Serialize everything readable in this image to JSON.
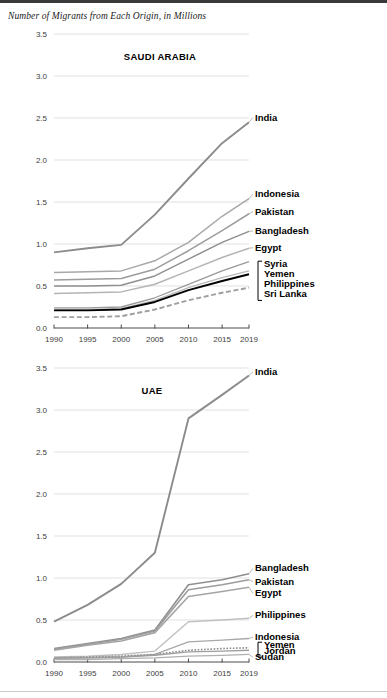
{
  "figure": {
    "title": "Number of Migrants from Each Origin, in Millions"
  },
  "chart_data": [
    {
      "type": "line",
      "title": "SAUDI ARABIA",
      "xlabel": "",
      "ylabel": "",
      "x": [
        1990,
        1995,
        2000,
        2005,
        2010,
        2015,
        2019
      ],
      "xticklabels": [
        "1990",
        "1995",
        "2000",
        "2005",
        "2010",
        "2015",
        "2019"
      ],
      "yticklabels": [
        "0.0",
        "0.5",
        "1.0",
        "1.5",
        "2.0",
        "2.5",
        "3.0",
        "3.5"
      ],
      "ylim": [
        0.0,
        3.5
      ],
      "ytickstep": 0.5,
      "grid": true,
      "legend_position": "right-inline",
      "series": [
        {
          "name": "India",
          "values": [
            0.9,
            0.95,
            0.99,
            1.35,
            1.78,
            2.2,
            2.45
          ],
          "color": "#8c8c8c",
          "style": "solid",
          "width": 1.9,
          "label_y": 2.47
        },
        {
          "name": "Indonesia",
          "values": [
            0.66,
            0.67,
            0.68,
            0.8,
            1.02,
            1.33,
            1.54
          ],
          "color": "#a8a8a8",
          "style": "solid",
          "width": 1.5,
          "label_y": 1.56
        },
        {
          "name": "Pakistan",
          "values": [
            0.57,
            0.58,
            0.59,
            0.7,
            0.92,
            1.16,
            1.36
          ],
          "color": "#9c9c9c",
          "style": "solid",
          "width": 1.5,
          "label_y": 1.35
        },
        {
          "name": "Bangladesh",
          "values": [
            0.5,
            0.5,
            0.51,
            0.62,
            0.82,
            1.02,
            1.15
          ],
          "color": "#8f8f8f",
          "style": "solid",
          "width": 1.5,
          "label_y": 1.12
        },
        {
          "name": "Egypt",
          "values": [
            0.41,
            0.42,
            0.43,
            0.52,
            0.68,
            0.84,
            0.95
          ],
          "color": "#b4b4b4",
          "style": "solid",
          "width": 1.5,
          "label_y": 0.92
        },
        {
          "name": "Syria",
          "values": [
            0.24,
            0.24,
            0.25,
            0.36,
            0.52,
            0.68,
            0.79
          ],
          "color": "#9a9a9a",
          "style": "solid",
          "width": 1.3,
          "label_y": 0.73
        },
        {
          "name": "Yemen",
          "values": [
            0.22,
            0.22,
            0.23,
            0.33,
            0.48,
            0.6,
            0.68
          ],
          "color": "#b9b9b9",
          "style": "solid",
          "width": 1.3,
          "label_y": 0.61
        },
        {
          "name": "Philippines",
          "values": [
            0.21,
            0.21,
            0.22,
            0.31,
            0.45,
            0.56,
            0.64
          ],
          "color": "#000000",
          "style": "solid",
          "width": 1.9,
          "label_y": 0.49
        },
        {
          "name": "Sri Lanka",
          "values": [
            0.13,
            0.13,
            0.14,
            0.22,
            0.33,
            0.42,
            0.48
          ],
          "color": "#9e9e9e",
          "style": "dashed",
          "width": 1.9,
          "label_y": 0.37
        }
      ],
      "brackets": [
        {
          "members": [
            "Syria",
            "Yemen",
            "Philippines",
            "Sri Lanka"
          ]
        }
      ]
    },
    {
      "type": "line",
      "title": "UAE",
      "xlabel": "",
      "ylabel": "",
      "x": [
        1990,
        1995,
        2000,
        2005,
        2010,
        2015,
        2019
      ],
      "xticklabels": [
        "1990",
        "1995",
        "2000",
        "2005",
        "2010",
        "2015",
        "2019"
      ],
      "yticklabels": [
        "0.0",
        "0.5",
        "1.0",
        "1.5",
        "2.0",
        "2.5",
        "3.0",
        "3.5"
      ],
      "ylim": [
        0.0,
        3.5
      ],
      "ytickstep": 0.5,
      "grid": true,
      "legend_position": "right-inline",
      "series": [
        {
          "name": "India",
          "values": [
            0.48,
            0.68,
            0.93,
            1.3,
            2.9,
            3.18,
            3.41
          ],
          "color": "#8c8c8c",
          "style": "solid",
          "width": 1.9,
          "label_y": 3.42
        },
        {
          "name": "Bangladesh",
          "values": [
            0.16,
            0.22,
            0.28,
            0.38,
            0.92,
            0.98,
            1.05
          ],
          "color": "#8f8f8f",
          "style": "solid",
          "width": 1.6,
          "label_y": 1.08
        },
        {
          "name": "Pakistan",
          "values": [
            0.15,
            0.21,
            0.27,
            0.37,
            0.86,
            0.92,
            0.98
          ],
          "color": "#9c9c9c",
          "style": "solid",
          "width": 1.6,
          "label_y": 0.92
        },
        {
          "name": "Egypt",
          "values": [
            0.14,
            0.2,
            0.25,
            0.35,
            0.78,
            0.84,
            0.89
          ],
          "color": "#a5a5a5",
          "style": "solid",
          "width": 1.6,
          "label_y": 0.78
        },
        {
          "name": "Philippines",
          "values": [
            0.06,
            0.07,
            0.09,
            0.13,
            0.48,
            0.5,
            0.52
          ],
          "color": "#c0c0c0",
          "style": "solid",
          "width": 1.4,
          "label_y": 0.52
        },
        {
          "name": "Indonesia",
          "values": [
            0.04,
            0.05,
            0.06,
            0.09,
            0.24,
            0.26,
            0.28
          ],
          "color": "#a8a8a8",
          "style": "solid",
          "width": 1.4,
          "label_y": 0.26
        },
        {
          "name": "Yemen",
          "values": [
            0.05,
            0.06,
            0.07,
            0.09,
            0.14,
            0.16,
            0.17
          ],
          "color": "#8a8a8a",
          "style": "dotted",
          "width": 1.6,
          "label_y": 0.17
        },
        {
          "name": "Jordan",
          "values": [
            0.05,
            0.05,
            0.06,
            0.08,
            0.12,
            0.13,
            0.14
          ],
          "color": "#9e9e9e",
          "style": "solid",
          "width": 1.4,
          "label_y": 0.1
        },
        {
          "name": "Sudan",
          "values": [
            0.03,
            0.03,
            0.04,
            0.05,
            0.07,
            0.08,
            0.09
          ],
          "color": "#b0b0b0",
          "style": "solid",
          "width": 1.3,
          "label_y": 0.02
        }
      ],
      "brackets": [
        {
          "members": [
            "Yemen",
            "Jordan"
          ]
        }
      ]
    }
  ]
}
